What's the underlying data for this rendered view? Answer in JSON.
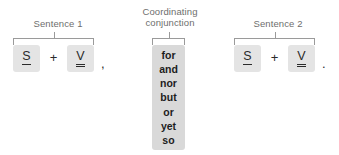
{
  "diagram": {
    "title_hidden": "",
    "colors": {
      "background": "#ffffff",
      "token_box": "#e4e4e4",
      "conjunction_box": "#d9d9d9",
      "label_text": "#6e6e6e",
      "glyph_text": "#2b2b2b",
      "bracket_line": "#9a9a9a"
    },
    "groups": [
      {
        "id": "sentence-1",
        "label": "Sentence 1",
        "tokens": [
          {
            "glyph": "S",
            "underline": "single",
            "meaning": "subject"
          },
          {
            "glyph": "+",
            "underline": "none",
            "meaning": "plus-operator"
          },
          {
            "glyph": "V",
            "underline": "double",
            "meaning": "verb"
          }
        ],
        "punctuation": ","
      },
      {
        "id": "coordinating-conjunction",
        "label": "Coordinating\nconjunction",
        "words": [
          "for",
          "and",
          "nor",
          "but",
          "or",
          "yet",
          "so"
        ]
      },
      {
        "id": "sentence-2",
        "label": "Sentence 2",
        "tokens": [
          {
            "glyph": "S",
            "underline": "single",
            "meaning": "subject"
          },
          {
            "glyph": "+",
            "underline": "none",
            "meaning": "plus-operator"
          },
          {
            "glyph": "V",
            "underline": "double",
            "meaning": "verb"
          }
        ],
        "punctuation": "."
      }
    ]
  }
}
